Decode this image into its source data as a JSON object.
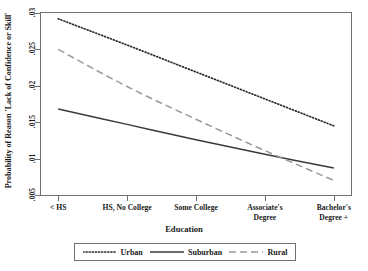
{
  "chart_data": {
    "type": "line",
    "title": "",
    "xlabel": "Education",
    "ylabel": "Probability of Reason 'Lack of Confidence or Skill'",
    "categories": [
      "< HS",
      "HS, No College",
      "Some College",
      "Associate's\nDegree",
      "Bachelor's\nDegree +"
    ],
    "x": [
      1,
      2,
      3,
      4,
      5
    ],
    "xlim": [
      0.75,
      5.25
    ],
    "ylim": [
      0.005,
      0.03
    ],
    "yticks": [
      0.005,
      0.01,
      0.015,
      0.02,
      0.025,
      0.03
    ],
    "ytick_labels": [
      ".005",
      ".01",
      ".015",
      ".02",
      ".025",
      ".03"
    ],
    "grid": false,
    "legend_position": "bottom",
    "series": [
      {
        "name": "Urban",
        "style": "dotted",
        "color": "#2b2b2b",
        "values": [
          0.0292,
          0.0256,
          0.0219,
          0.0182,
          0.0145
        ]
      },
      {
        "name": "Suburban",
        "style": "solid",
        "color": "#3a3a3a",
        "values": [
          0.0168,
          0.0147,
          0.0126,
          0.0106,
          0.0087
        ]
      },
      {
        "name": "Rural",
        "style": "dashed",
        "color": "#9a9a9a",
        "values": [
          0.025,
          0.0199,
          0.0154,
          0.0111,
          0.007
        ]
      }
    ]
  },
  "axes": {
    "y_title": "Probability of Reason 'Lack of Confidence or Skill'",
    "x_title": "Education",
    "ytick_0": ".005",
    "ytick_1": ".01",
    "ytick_2": ".015",
    "ytick_3": ".02",
    "ytick_4": ".025",
    "ytick_5": ".03",
    "xtick_0": "< HS",
    "xtick_1": "HS, No College",
    "xtick_2": "Some College",
    "xtick_3_line1": "Associate's",
    "xtick_3_line2": "Degree",
    "xtick_4_line1": "Bachelor's",
    "xtick_4_line2": "Degree +"
  },
  "legend": {
    "items": [
      {
        "label": "Urban",
        "style": "dotted",
        "color": "#2b2b2b"
      },
      {
        "label": "Suburban",
        "style": "solid",
        "color": "#3a3a3a"
      },
      {
        "label": "Rural",
        "style": "dashed",
        "color": "#9a9a9a"
      }
    ]
  },
  "colors": {
    "frame": "#6f6f6f",
    "text": "#1a1a1a",
    "background": "#ffffff"
  }
}
